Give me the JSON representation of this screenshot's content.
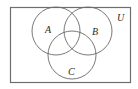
{
  "diagram": {
    "type": "venn-diagram",
    "universe": {
      "label": "U",
      "rect": {
        "x": 10,
        "y": 7,
        "width": 120,
        "height": 75
      },
      "stroke": "#6e6e6e"
    },
    "sets": [
      {
        "label": "A",
        "cx": 56,
        "cy": 31,
        "r": 24,
        "label_x": 47,
        "label_y": 33
      },
      {
        "label": "B",
        "cx": 88,
        "cy": 31,
        "r": 24,
        "label_x": 95,
        "label_y": 35
      },
      {
        "label": "C",
        "cx": 72,
        "cy": 55,
        "r": 24,
        "label_x": 71,
        "label_y": 75
      }
    ],
    "universe_label_pos": {
      "x": 121,
      "y": 21
    },
    "circle_stroke": "#6a6a6a",
    "background": "#ffffff"
  }
}
